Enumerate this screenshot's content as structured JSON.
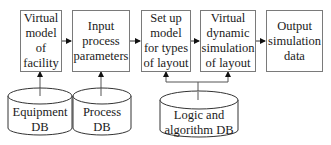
{
  "diagram": {
    "type": "flowchart",
    "process_steps": [
      {
        "id": "s1",
        "label": "Virtual\nmodel\nof\nfacility"
      },
      {
        "id": "s2",
        "label": "Input\nprocess\nparameters"
      },
      {
        "id": "s3",
        "label": "Set up\nmodel\nfor types\nof layout"
      },
      {
        "id": "s4",
        "label": "Virtual\ndynamic\nsimulation\nof layout"
      },
      {
        "id": "s5",
        "label": "Output\nsimulation\ndata"
      }
    ],
    "databases": [
      {
        "id": "db1",
        "label": "Equipment\nDB",
        "feeds": [
          "s1"
        ]
      },
      {
        "id": "db2",
        "label": "Process DB",
        "feeds": [
          "s2"
        ]
      },
      {
        "id": "db3",
        "label": "Logic and\nalgorithm DB",
        "feeds": [
          "s3",
          "s4"
        ]
      }
    ],
    "edges": [
      [
        "s1",
        "s2"
      ],
      [
        "s2",
        "s3"
      ],
      [
        "s3",
        "s4"
      ],
      [
        "s4",
        "s5"
      ],
      [
        "db1",
        "s1"
      ],
      [
        "db2",
        "s2"
      ],
      [
        "db3",
        "s3"
      ],
      [
        "db3",
        "s4"
      ]
    ],
    "colors": {
      "stroke": "#7a7a7a",
      "arrow": "#111111",
      "text": "#1a1a1a"
    }
  }
}
